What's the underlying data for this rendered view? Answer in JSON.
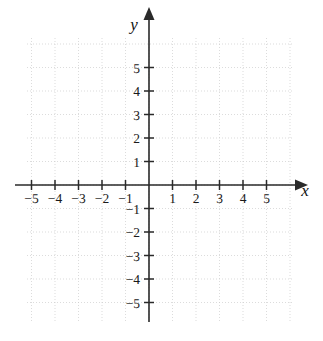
{
  "figure": {
    "kind": "cartesian-coordinate-plane",
    "title": "",
    "background_color": "#ffffff",
    "axis_color": "#2a2a2a",
    "grid_color": "#c9c9c9",
    "label_color": "#1a1a1a"
  },
  "axes": {
    "x": {
      "name": "x",
      "tick_labels": [
        "-5",
        "-4",
        "-3",
        "-2",
        "-1",
        "1",
        "2",
        "3",
        "4",
        "5"
      ],
      "tick_values": [
        -5,
        -4,
        -3,
        -2,
        -1,
        1,
        2,
        3,
        4,
        5
      ],
      "range": [
        -5.7,
        6.7
      ],
      "arrow": "right"
    },
    "y": {
      "name": "y",
      "tick_labels": [
        "5",
        "4",
        "3",
        "2",
        "1",
        "-1",
        "-2",
        "-3",
        "-4",
        "-5"
      ],
      "tick_values": [
        5,
        4,
        3,
        2,
        1,
        -1,
        -2,
        -3,
        -4,
        -5
      ],
      "range": [
        -5.8,
        6.9
      ],
      "arrow": "up"
    }
  },
  "chart_data": {
    "type": "scatter",
    "title": "",
    "xlabel": "x",
    "ylabel": "y",
    "x": [],
    "y": [],
    "series": [],
    "xlim": [
      -5.7,
      6.7
    ],
    "ylim": [
      -5.8,
      6.9
    ],
    "xticks": [
      -5,
      -4,
      -3,
      -2,
      -1,
      1,
      2,
      3,
      4,
      5
    ],
    "yticks": [
      -5,
      -4,
      -3,
      -2,
      -1,
      1,
      2,
      3,
      4,
      5
    ],
    "xticklabels": [
      "-5",
      "-4",
      "-3",
      "-2",
      "-1",
      "1",
      "2",
      "3",
      "4",
      "5"
    ],
    "yticklabels": [
      "-5",
      "-4",
      "-3",
      "-2",
      "-1",
      "1",
      "2",
      "3",
      "4",
      "5"
    ],
    "grid": true,
    "grid_style": "dotted",
    "legend": null,
    "annotations": [],
    "note": "Empty graph paper: no plotted data points, lines or curves."
  },
  "geometry": {
    "origin_px": {
      "x": 149,
      "y": 185
    },
    "unit_px": 23.5,
    "grid_extent_px": {
      "left": 27,
      "right": 292,
      "top": 38,
      "bottom": 323
    }
  }
}
